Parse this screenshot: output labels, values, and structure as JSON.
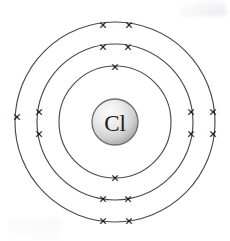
{
  "diagram": {
    "element_symbol": "Cl",
    "element_name": "Chlorine",
    "background_color": "#ffffff",
    "shell_stroke_color": "#4a4a52",
    "electron_color": "#14141c",
    "nucleus_fill_light": "#f2f2f2",
    "nucleus_fill_dark": "#9a9a9a",
    "nucleus_stroke_color": "#6d6d72",
    "electron_glyph": "×",
    "center_x": 115,
    "center_y": 122,
    "nucleus_radius": 23,
    "electron_configuration": "2, 8, 7",
    "total_electrons": 17,
    "shells": [
      {
        "name": "shell-1",
        "label": "K shell",
        "radius": 56,
        "electron_count": 2,
        "electrons": [
          {
            "name": "electron-1-top",
            "x": 115,
            "y": 67
          },
          {
            "name": "electron-1-bottom",
            "x": 115,
            "y": 178
          }
        ]
      },
      {
        "name": "shell-2",
        "label": "L shell",
        "radius": 78,
        "electron_count": 8,
        "electrons": [
          {
            "name": "electron-2-top-left",
            "x": 103,
            "y": 47
          },
          {
            "name": "electron-2-top-right",
            "x": 128,
            "y": 47
          },
          {
            "name": "electron-2-right-upper",
            "x": 191,
            "y": 112
          },
          {
            "name": "electron-2-right-lower",
            "x": 191,
            "y": 134
          },
          {
            "name": "electron-2-bottom-right",
            "x": 128,
            "y": 199
          },
          {
            "name": "electron-2-bottom-left",
            "x": 103,
            "y": 199
          },
          {
            "name": "electron-2-left-lower",
            "x": 39,
            "y": 134
          },
          {
            "name": "electron-2-left-upper",
            "x": 39,
            "y": 112
          }
        ]
      },
      {
        "name": "shell-3",
        "label": "M shell",
        "radius": 100,
        "electron_count": 7,
        "electrons": [
          {
            "name": "electron-3-top-left",
            "x": 103,
            "y": 25
          },
          {
            "name": "electron-3-top-right",
            "x": 129,
            "y": 25
          },
          {
            "name": "electron-3-right-upper",
            "x": 213,
            "y": 112
          },
          {
            "name": "electron-3-right-lower",
            "x": 213,
            "y": 134
          },
          {
            "name": "electron-3-bottom-right",
            "x": 129,
            "y": 221
          },
          {
            "name": "electron-3-bottom-left",
            "x": 103,
            "y": 221
          },
          {
            "name": "electron-3-left",
            "x": 17,
            "y": 117
          }
        ]
      }
    ]
  }
}
